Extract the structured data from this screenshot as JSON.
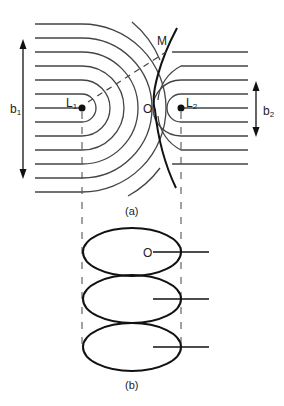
{
  "figure": {
    "part_a": {
      "caption": "(a)",
      "labels": {
        "m": "M",
        "o": "O",
        "l1": "L",
        "l1_sub": "1",
        "l2": "L",
        "l2_sub": "2",
        "b1": "b",
        "b1_sub": "1",
        "b2": "b",
        "b2_sub": "2"
      }
    },
    "part_b": {
      "caption": "(b)",
      "labels": {
        "o": "O"
      },
      "ellipse_count": 3
    }
  }
}
